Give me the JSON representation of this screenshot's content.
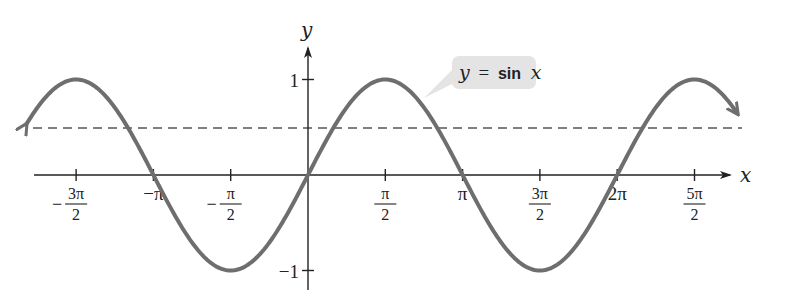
{
  "chart_data": {
    "type": "line",
    "title": "",
    "xlabel": "x",
    "ylabel": "y",
    "function": "y = sin x",
    "xlim": [
      -4.9,
      8.7
    ],
    "ylim": [
      -1.1,
      1.4
    ],
    "grid": false,
    "legend_position": "annotation callout near x = 3π/4",
    "x_ticks": [
      {
        "value": -4.712,
        "num": "3π",
        "den": "2",
        "sign": "−",
        "kind": "frac"
      },
      {
        "value": -3.1416,
        "text": "−π",
        "kind": "plain"
      },
      {
        "value": -1.5708,
        "num": "π",
        "den": "2",
        "sign": "−",
        "kind": "frac"
      },
      {
        "value": 1.5708,
        "num": "π",
        "den": "2",
        "sign": "",
        "kind": "frac"
      },
      {
        "value": 3.1416,
        "text": "π",
        "kind": "plain"
      },
      {
        "value": 4.712,
        "num": "3π",
        "den": "2",
        "sign": "",
        "kind": "frac"
      },
      {
        "value": 6.2832,
        "text": "2π",
        "kind": "plain"
      },
      {
        "value": 7.854,
        "num": "5π",
        "den": "2",
        "sign": "",
        "kind": "frac"
      }
    ],
    "y_ticks": [
      {
        "value": 1,
        "text": "1"
      },
      {
        "value": -1,
        "text": "−1"
      }
    ],
    "series": [
      {
        "name": "y = sin x",
        "x_range": [
          -5.73,
          8.72
        ],
        "color": "#6e6e6e",
        "arrows_both_ends": true,
        "sample_points": [
          {
            "x": -4.712,
            "y": 1
          },
          {
            "x": -3.1416,
            "y": 0
          },
          {
            "x": -1.5708,
            "y": -1
          },
          {
            "x": 0,
            "y": 0
          },
          {
            "x": 1.5708,
            "y": 1
          },
          {
            "x": 3.1416,
            "y": 0
          },
          {
            "x": 4.712,
            "y": -1
          },
          {
            "x": 6.2832,
            "y": 0
          },
          {
            "x": 7.854,
            "y": 1
          }
        ]
      }
    ],
    "reference_lines": [
      {
        "type": "horizontal",
        "y": 0.5,
        "style": "dashed",
        "color": "#555555"
      }
    ],
    "annotation": {
      "text_y": "y",
      "text_eq": "=",
      "text_fn": "sin",
      "text_x": "x"
    }
  },
  "axes": {
    "x_label": "x",
    "y_label": "y"
  },
  "colors": {
    "curve": "#6e6e6e",
    "axis": "#222222",
    "dashed": "#555555",
    "callout_bg": "#e4e4e4"
  }
}
